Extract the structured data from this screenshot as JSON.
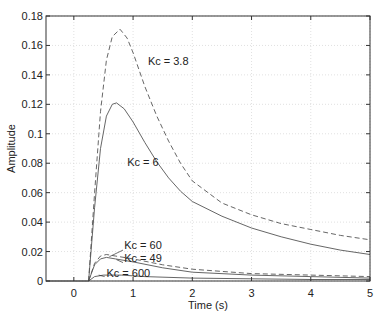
{
  "chart_data": {
    "type": "line",
    "title": "",
    "xlabel": "Time (s)",
    "ylabel": "Amplitude",
    "xlim": [
      -0.47,
      5
    ],
    "ylim": [
      0,
      0.18
    ],
    "grid": true,
    "legend": "none (inline annotations)",
    "x_ticks": [
      "0",
      "1",
      "2",
      "3",
      "4",
      "5"
    ],
    "y_ticks": [
      "0",
      "0.02",
      "0.04",
      "0.06",
      "0.08",
      "0.1",
      "0.12",
      "0.14",
      "0.16",
      "0.18"
    ],
    "series": [
      {
        "name": "Kc = 3.8",
        "style": "dashed",
        "x": [
          0.25,
          0.35,
          0.45,
          0.55,
          0.65,
          0.78,
          0.9,
          1.0,
          1.2,
          1.4,
          1.6,
          1.8,
          2.0,
          2.5,
          3.0,
          3.5,
          4.0,
          4.5,
          5.0
        ],
        "y": [
          0,
          0.06,
          0.115,
          0.15,
          0.166,
          0.171,
          0.165,
          0.155,
          0.132,
          0.112,
          0.095,
          0.08,
          0.068,
          0.053,
          0.045,
          0.039,
          0.035,
          0.031,
          0.028
        ]
      },
      {
        "name": "Kc = 6",
        "style": "solid",
        "x": [
          0.25,
          0.35,
          0.45,
          0.55,
          0.65,
          0.72,
          0.85,
          1.0,
          1.2,
          1.4,
          1.6,
          1.8,
          2.0,
          2.5,
          3.0,
          3.5,
          4.0,
          4.5,
          5.0
        ],
        "y": [
          0,
          0.05,
          0.09,
          0.112,
          0.12,
          0.121,
          0.117,
          0.108,
          0.094,
          0.081,
          0.07,
          0.061,
          0.054,
          0.044,
          0.036,
          0.03,
          0.025,
          0.021,
          0.018
        ]
      },
      {
        "name": "Kc = 60",
        "style": "dashed",
        "x": [
          0.25,
          0.35,
          0.45,
          0.55,
          0.7,
          1.0,
          1.5,
          2.0,
          3.0,
          4.0,
          5.0
        ],
        "y": [
          0,
          0.012,
          0.017,
          0.018,
          0.017,
          0.015,
          0.011,
          0.008,
          0.005,
          0.004,
          0.003
        ]
      },
      {
        "name": "Kc = 49",
        "style": "solid",
        "x": [
          0.25,
          0.35,
          0.45,
          0.55,
          0.7,
          1.0,
          1.5,
          2.0,
          3.0,
          4.0,
          5.0
        ],
        "y": [
          0,
          0.011,
          0.015,
          0.016,
          0.015,
          0.013,
          0.009,
          0.006,
          0.004,
          0.003,
          0.002
        ]
      },
      {
        "name": "Kc = 600",
        "style": "solid",
        "x": [
          0.25,
          0.35,
          0.5,
          0.8,
          1.2,
          2.0,
          3.0,
          4.0,
          5.0
        ],
        "y": [
          0,
          0.003,
          0.004,
          0.004,
          0.003,
          0.002,
          0.0015,
          0.001,
          0.001
        ]
      }
    ],
    "annotations": [
      {
        "text": "Kc = 3.8",
        "x": 1.25,
        "y": 0.147
      },
      {
        "text": "Kc = 6",
        "x": 0.9,
        "y": 0.078
      },
      {
        "text": "Kc = 60",
        "x": 0.85,
        "y": 0.022
      },
      {
        "text": "Kc = 49",
        "x": 0.85,
        "y": 0.013
      },
      {
        "text": "Kc = 600",
        "x": 0.55,
        "y": 0.003
      }
    ],
    "colors": {
      "axis": "#333333",
      "grid": "#cccccc",
      "line": "#555555"
    }
  }
}
